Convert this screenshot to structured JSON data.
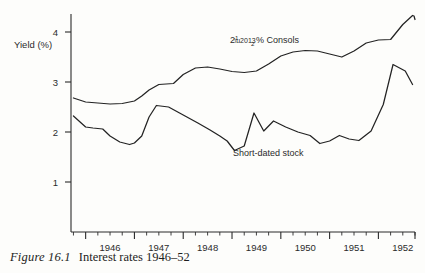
{
  "figure": {
    "caption_label": "Figure 16.1",
    "caption_text": "Interest rates 1946–52"
  },
  "chart_data": {
    "type": "line",
    "title": "Interest rates 1946–52",
    "xlabel": "",
    "ylabel": "Yield (%)",
    "ylim": [
      0,
      4.6
    ],
    "xlim": [
      1945.7,
      1952.75
    ],
    "grid": false,
    "legend": "inline-annotations",
    "yticks": [
      1,
      2,
      3,
      4
    ],
    "ytick_labels": [
      "1",
      "2",
      "3",
      "4"
    ],
    "xticks": [
      1946,
      1947,
      1948,
      1949,
      1950,
      1951,
      1952
    ],
    "xtick_labels": [
      "1946",
      "1947",
      "1948",
      "1949",
      "1950",
      "1951",
      "1952"
    ],
    "xtick_minor_step": 0.25,
    "series": [
      {
        "name": "2½% Consols",
        "label_prefix": "2",
        "label_frac_num": "1",
        "label_frac_den": "2",
        "label_suffix": "% Consols",
        "color": "#232323",
        "x": [
          1945.75,
          1946.0,
          1946.25,
          1946.5,
          1946.75,
          1947.0,
          1947.15,
          1947.3,
          1947.5,
          1947.65,
          1947.8,
          1948.0,
          1948.25,
          1948.5,
          1948.75,
          1949.0,
          1949.25,
          1949.5,
          1949.75,
          1950.0,
          1950.25,
          1950.5,
          1950.75,
          1951.0,
          1951.25,
          1951.5,
          1951.75,
          1952.0,
          1952.25,
          1952.5,
          1952.7
        ],
        "values": [
          2.68,
          2.6,
          2.58,
          2.56,
          2.57,
          2.62,
          2.72,
          2.84,
          2.95,
          2.96,
          2.97,
          3.15,
          3.28,
          3.3,
          3.26,
          3.21,
          3.19,
          3.22,
          3.36,
          3.52,
          3.6,
          3.63,
          3.62,
          3.56,
          3.5,
          3.62,
          3.78,
          3.84,
          3.85,
          4.15,
          4.33
        ],
        "end_values": [
          4.33,
          4.32,
          4.25
        ]
      },
      {
        "name": "Short-dated stock",
        "label_suffix": "Short-dated stock",
        "color": "#232323",
        "x": [
          1945.75,
          1946.0,
          1946.15,
          1946.35,
          1946.5,
          1946.7,
          1946.9,
          1947.0,
          1947.15,
          1947.3,
          1947.45,
          1947.7,
          1948.0,
          1948.3,
          1948.55,
          1948.75,
          1948.9,
          1949.05,
          1949.25,
          1949.45,
          1949.65,
          1949.85,
          1950.1,
          1950.35,
          1950.6,
          1950.8,
          1951.0,
          1951.2,
          1951.4,
          1951.6,
          1951.85,
          1952.1,
          1952.3,
          1952.55,
          1952.7
        ],
        "values": [
          2.32,
          2.1,
          2.08,
          2.06,
          1.92,
          1.8,
          1.75,
          1.78,
          1.92,
          2.3,
          2.53,
          2.5,
          2.34,
          2.18,
          2.04,
          1.92,
          1.82,
          1.63,
          1.72,
          2.38,
          2.02,
          2.22,
          2.1,
          2.0,
          1.93,
          1.77,
          1.82,
          1.93,
          1.86,
          1.83,
          2.02,
          2.55,
          3.35,
          3.22,
          2.95
        ],
        "peak_value": 3.35,
        "trough_value": 1.63
      }
    ]
  }
}
